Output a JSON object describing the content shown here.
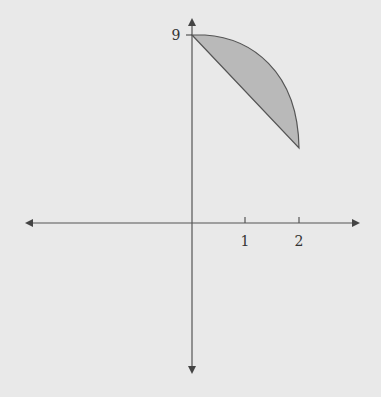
{
  "diagram": {
    "type": "region-between-curves",
    "x_axis": {
      "ticks": [
        {
          "value": 1,
          "label": "1"
        },
        {
          "value": 2,
          "label": "2"
        }
      ]
    },
    "y_axis": {
      "ticks": [
        {
          "value": 9,
          "label": "9"
        }
      ]
    },
    "region": {
      "description": "Shaded region bounded above by a concave-down curve from (0,9) to (2,~5) and below by a straight line from (0,9) to (2,~5)",
      "fill": "#b9b9b9",
      "stroke": "#555555"
    },
    "colors": {
      "background": "#e9e9e9",
      "axis": "#555555"
    }
  }
}
